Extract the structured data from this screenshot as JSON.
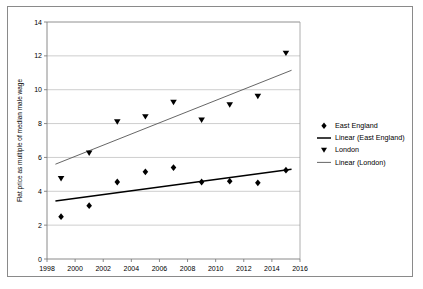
{
  "chart_data": {
    "type": "scatter",
    "title": "",
    "xlabel": "",
    "ylabel": "Flat price as multiple of median male wage",
    "xlim": [
      1998,
      2016
    ],
    "ylim": [
      0,
      14
    ],
    "xticks": [
      "1998",
      "2000",
      "2002",
      "2004",
      "2006",
      "2008",
      "2010",
      "2012",
      "2014",
      "2016"
    ],
    "yticks": [
      "0",
      "2",
      "4",
      "6",
      "8",
      "10",
      "12",
      "14"
    ],
    "xtick_values": [
      1998,
      2000,
      2002,
      2004,
      2006,
      2008,
      2010,
      2012,
      2014,
      2016
    ],
    "ytick_values": [
      0,
      2,
      4,
      6,
      8,
      10,
      12,
      14
    ],
    "grid": "horizontal",
    "legend_position": "right",
    "series": [
      {
        "name": "East England",
        "marker": "diamond",
        "color": "#000000",
        "x": [
          1999,
          2001,
          2003,
          2005,
          2007,
          2009,
          2011,
          2013,
          2015
        ],
        "values": [
          2.5,
          3.15,
          4.55,
          5.15,
          5.4,
          4.55,
          4.6,
          4.5,
          5.25
        ]
      },
      {
        "name": "Linear (East England)",
        "type": "trendline",
        "color": "#000000",
        "x": [
          1998.6,
          2015.4
        ],
        "values": [
          3.42,
          5.3
        ]
      },
      {
        "name": "London",
        "marker": "triangle-down",
        "color": "#000000",
        "x": [
          1999,
          2001,
          2003,
          2005,
          2007,
          2009,
          2011,
          2013,
          2015
        ],
        "values": [
          4.75,
          6.25,
          8.1,
          8.4,
          9.25,
          8.2,
          9.1,
          9.6,
          12.15
        ]
      },
      {
        "name": "Linear (London)",
        "type": "trendline",
        "color": "#555555",
        "x": [
          1998.6,
          2015.4
        ],
        "values": [
          5.6,
          11.15
        ]
      }
    ],
    "legend": [
      {
        "label": "East England",
        "symbol": "diamond"
      },
      {
        "label": "Linear (East England)",
        "symbol": "line-thick"
      },
      {
        "label": "London",
        "symbol": "triangle-down"
      },
      {
        "label": "Linear (London)",
        "symbol": "line-thin"
      }
    ]
  }
}
